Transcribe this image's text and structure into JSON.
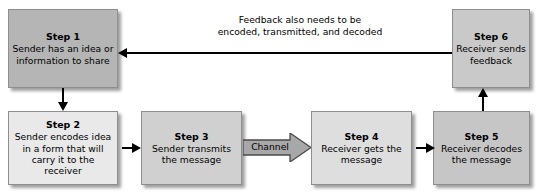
{
  "diagram": {
    "boxes": [
      {
        "id": "step1",
        "title": "Step 1",
        "desc": "Sender has an idea or information to share",
        "fill": "#b5b5b5"
      },
      {
        "id": "step2",
        "title": "Step 2",
        "desc": "Sender encodes idea in a form that will carry it to the receiver",
        "fill": "#e9e9e9"
      },
      {
        "id": "step3",
        "title": "Step 3",
        "desc": "Sender transmits the message",
        "fill": "#d0d0d0"
      },
      {
        "id": "step4",
        "title": "Step 4",
        "desc": "Receiver gets the message",
        "fill": "#dedede"
      },
      {
        "id": "step5",
        "title": "Step 5",
        "desc": "Receiver decodes the message",
        "fill": "#c6c6c6"
      },
      {
        "id": "step6",
        "title": "Step 6",
        "desc": "Receiver sends feedback",
        "fill": "#c9c9c9"
      }
    ],
    "channel": {
      "label": "Channel",
      "fill": "#a8a8a8"
    },
    "feedback": {
      "line1": "Feedback also needs to be",
      "line2": "encoded, transmitted, and decoded"
    },
    "colors": {
      "line": "#000000",
      "border": "#8e8e8e",
      "background": "#ffffff"
    }
  }
}
